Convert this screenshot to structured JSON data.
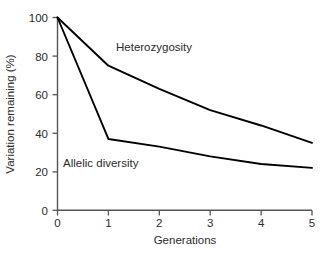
{
  "chart_data": {
    "type": "line",
    "title": "",
    "xlabel": "Generations",
    "ylabel": "Variation remaining (%)",
    "x": [
      0,
      1,
      2,
      3,
      4,
      5
    ],
    "xlim": [
      0,
      5
    ],
    "ylim": [
      0,
      100
    ],
    "xticks": [
      "0",
      "1",
      "2",
      "3",
      "4",
      "5"
    ],
    "yticks": [
      "0",
      "20",
      "40",
      "60",
      "80",
      "100"
    ],
    "grid": false,
    "legend_position": "inline-annotations",
    "series": [
      {
        "name": "Heterozygosity",
        "color": "#000000",
        "values": [
          100,
          75,
          63,
          52,
          44,
          35
        ]
      },
      {
        "name": "Allelic diversity",
        "color": "#000000",
        "values": [
          100,
          37,
          33,
          28,
          24,
          22
        ]
      }
    ],
    "annotations": [
      {
        "text": "Heterozygosity",
        "x": 1.45,
        "y": 80
      },
      {
        "text": "Allelic diversity",
        "x": 0.35,
        "y": 25
      }
    ]
  },
  "axis": {
    "line_color": "#555555",
    "tick_color": "#555555"
  },
  "ticks": {
    "y": [
      "100",
      "80",
      "60",
      "40",
      "20",
      "0"
    ],
    "x": [
      "0",
      "1",
      "2",
      "3",
      "4",
      "5"
    ]
  },
  "labels": {
    "x_title": "Generations",
    "y_title": "Variation remaining (%)",
    "series_heterozygosity": "Heterozygosity",
    "series_allelic": "Allelic diversity"
  }
}
